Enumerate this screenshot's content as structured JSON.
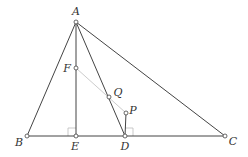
{
  "diagram": {
    "colors": {
      "line": "#444444",
      "aux_line": "#cccccc",
      "right_angle": "#bbbbbb",
      "label": "#333333",
      "point_fill": "#ffffff"
    },
    "points": {
      "A": {
        "label": "A",
        "x": 76,
        "y": 22,
        "lx": 76,
        "ly": 15
      },
      "B": {
        "label": "B",
        "x": 27,
        "y": 136,
        "lx": 19,
        "ly": 146
      },
      "C": {
        "label": "C",
        "x": 225,
        "y": 136,
        "lx": 233,
        "ly": 145
      },
      "D": {
        "label": "D",
        "x": 125,
        "y": 136,
        "lx": 125,
        "ly": 150
      },
      "E": {
        "label": "E",
        "x": 76,
        "y": 136,
        "lx": 75,
        "ly": 150
      },
      "F": {
        "label": "F",
        "x": 76,
        "y": 68,
        "lx": 67,
        "ly": 72
      },
      "Q": {
        "label": "Q",
        "x": 109,
        "y": 97,
        "lx": 118,
        "ly": 96
      },
      "P": {
        "label": "P",
        "x": 126,
        "y": 113,
        "lx": 133,
        "ly": 114
      }
    },
    "segments": [
      "AB",
      "AC",
      "BC",
      "AE",
      "AD",
      "PD"
    ],
    "aux_segments": [
      "FP"
    ],
    "right_angles": [
      "E",
      "D"
    ]
  }
}
